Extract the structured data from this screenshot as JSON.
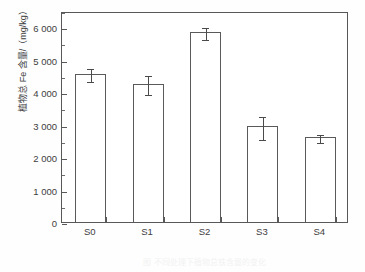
{
  "chart_data": {
    "type": "bar",
    "title": "",
    "subtitle": "",
    "xlabel": "",
    "ylabel": "植物总 Fe 含量/（mg/kg）",
    "categories": [
      "S0",
      "S1",
      "S2",
      "S3",
      "S4"
    ],
    "values": [
      4570,
      4260,
      5850,
      2950,
      2620
    ],
    "errors": [
      190,
      300,
      180,
      360,
      120
    ],
    "series": [
      {
        "name": "植物总 Fe 含量",
        "values": [
          4570,
          4260,
          5850,
          2950,
          2620
        ],
        "errors": [
          190,
          300,
          180,
          360,
          120
        ]
      }
    ],
    "ylim": [
      0,
      6500
    ],
    "ytick_values": [
      0,
      1000,
      2000,
      3000,
      4000,
      5000,
      6000
    ],
    "ytick_labels": [
      "0",
      "1 000",
      "2 000",
      "3 000",
      "4 000",
      "5 000",
      "6 000"
    ],
    "yminor_values": [
      500,
      1500,
      2500,
      3500,
      4500,
      5500,
      6500
    ],
    "grid": false,
    "legend": null,
    "legend_position": "none",
    "frame": "box",
    "bar_fill": "#ffffff",
    "bar_edge": "#5a5a5a",
    "errorbar_color": "#4a4a4a",
    "axis_color": "#585858",
    "text_color": "#3d3d3d",
    "background": "#fefefe",
    "annotations": []
  },
  "caption": {
    "text": "图  不同处理下植物总铁含量的变化"
  }
}
